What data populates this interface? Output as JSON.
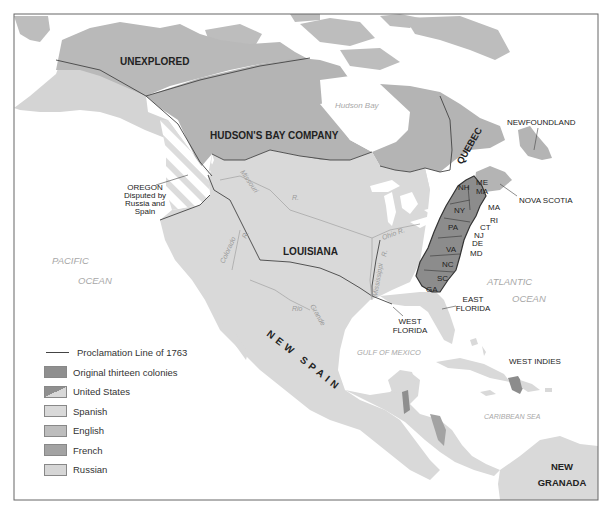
{
  "title_regions": {
    "unexplored": "UNEXPLORED",
    "hudsons_bay": "HUDSON'S BAY COMPANY",
    "quebec": "QUEBEC",
    "newfoundland": "NEWFOUNDLAND",
    "nova_scotia": "NOVA SCOTIA",
    "louisiana": "LOUISIANA",
    "new_spain": "NEW SPAIN",
    "east_florida": [
      "EAST",
      "FLORIDA"
    ],
    "west_florida": [
      "WEST",
      "FLORIDA"
    ],
    "west_indies": "WEST INDIES",
    "new_granada": [
      "NEW",
      "GRANADA"
    ],
    "oregon": [
      "OREGON",
      "Disputed by",
      "Russia and",
      "Spain"
    ]
  },
  "colonies": [
    "NH",
    "ME",
    "MA",
    "MA",
    "RI",
    "CT",
    "NJ",
    "DE",
    "MD",
    "NY",
    "PA",
    "VA",
    "NC",
    "SC",
    "GA"
  ],
  "colony_labels": {
    "nh": "NH",
    "me": "ME",
    "ma_inner": "MA",
    "ma": "MA",
    "ri": "RI",
    "ct": "CT",
    "nj": "NJ",
    "de": "DE",
    "md": "MD",
    "ny": "NY",
    "pa": "PA",
    "va": "VA",
    "nc": "NC",
    "sc": "SC",
    "ga": "GA"
  },
  "water_labels": {
    "hudson_bay": "Hudson Bay",
    "pacific": [
      "PACIFIC",
      "OCEAN"
    ],
    "atlantic": [
      "ATLANTIC",
      "OCEAN"
    ],
    "gulf": "GULF OF MEXICO",
    "caribbean": "CARIBBEAN SEA"
  },
  "rivers": {
    "missouri": "Missouri",
    "missouri_r": "R.",
    "ohio": "Ohio R.",
    "mississippi": "Mississippi",
    "mississippi_r": "R.",
    "colorado": "Colorado",
    "colorado_r": "R.",
    "rio": "Rio",
    "grande": "Grande"
  },
  "legend": {
    "items": [
      {
        "type": "line",
        "label": "Proclamation Line of 1763"
      },
      {
        "type": "fill",
        "label": "Original thirteen colonies",
        "color": "#8f8f8f"
      },
      {
        "type": "split",
        "label": "United States",
        "color": "#8f8f8f",
        "color2": "#d8d8d8"
      },
      {
        "type": "fill",
        "label": "Spanish",
        "color": "#d9d9d9"
      },
      {
        "type": "fill",
        "label": "English",
        "color": "#bdbdbd"
      },
      {
        "type": "fill",
        "label": "French",
        "color": "#a3a3a3"
      },
      {
        "type": "fill",
        "label": "Russian",
        "color": "#d6d6d6"
      }
    ]
  },
  "colors": {
    "english": "#b9b9b9",
    "spanish": "#d9d9d9",
    "colonies": "#8c8c8c",
    "russian": "#d4d4d4",
    "water": "#ffffff",
    "border": "#444444"
  }
}
